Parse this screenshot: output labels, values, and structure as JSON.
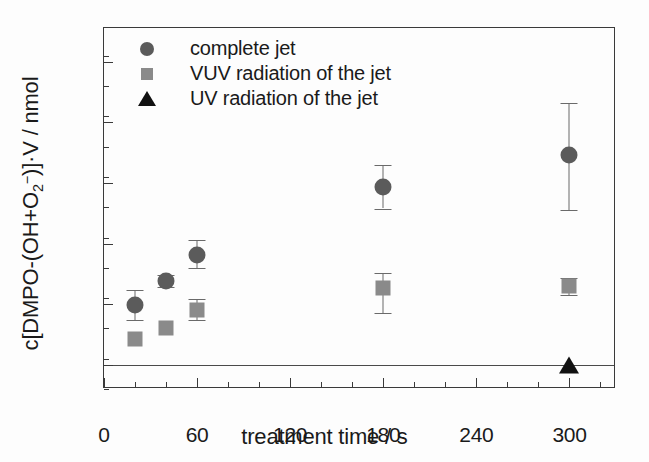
{
  "chart_data": {
    "type": "scatter",
    "title": "",
    "xlabel": "treatment time / s",
    "ylabel": "c[DMPO-(OH+O2-)]·V / nmol",
    "ylabel_parts": {
      "prefix": "c[DMPO-(OH+O",
      "sub": "2",
      "sup": "−",
      "suffix": ")]·V / nmol"
    },
    "xlim": [
      0,
      330
    ],
    "ylim": [
      -2.0,
      27.8
    ],
    "xticks": [
      0,
      60,
      120,
      180,
      240,
      300
    ],
    "xtick_labels": [
      "0",
      "60",
      "120",
      "180",
      "240",
      "300"
    ],
    "xminor_step": 20,
    "yticks": [
      0,
      5,
      10,
      15,
      20,
      25
    ],
    "ytick_labels": [
      "0",
      "5",
      "10",
      "15",
      "20",
      "25"
    ],
    "yminor_step": 2.5,
    "grid": false,
    "zero_line": 0,
    "legend_position": "top-left",
    "series": [
      {
        "name": "complete jet",
        "marker": "circle",
        "color": "#5b5b5b",
        "x": [
          20,
          40,
          60,
          180,
          300
        ],
        "values": [
          4.9,
          6.9,
          9.1,
          14.7,
          17.3
        ],
        "yerr_low": [
          1.2,
          0.5,
          1.1,
          1.8,
          4.5
        ],
        "yerr_high": [
          1.3,
          0.5,
          1.2,
          1.8,
          4.3
        ]
      },
      {
        "name": "VUV radiation of the jet",
        "marker": "square",
        "color": "#8a8a8a",
        "x": [
          20,
          40,
          60,
          180,
          300
        ],
        "values": [
          2.1,
          3.0,
          4.5,
          6.3,
          6.5
        ],
        "yerr_low": [
          0.0,
          0.0,
          0.8,
          2.0,
          0.7
        ],
        "yerr_high": [
          0.0,
          0.0,
          0.9,
          1.3,
          0.7
        ]
      },
      {
        "name": "UV radiation of the jet",
        "marker": "triangle",
        "color": "#111111",
        "x": [
          300
        ],
        "values": [
          0.0
        ],
        "yerr_low": [
          0.0
        ],
        "yerr_high": [
          0.0
        ]
      }
    ]
  },
  "legend": {
    "entries": [
      {
        "label": "complete jet",
        "marker": "circle"
      },
      {
        "label": "VUV radiation of the jet",
        "marker": "square"
      },
      {
        "label": "UV radiation of the jet",
        "marker": "triangle"
      }
    ]
  },
  "colors": {
    "complete_jet": "#5b5b5b",
    "vuv": "#8a8a8a",
    "uv": "#111111",
    "axis": "#3a3a3a",
    "background": "#fdfdfd"
  }
}
